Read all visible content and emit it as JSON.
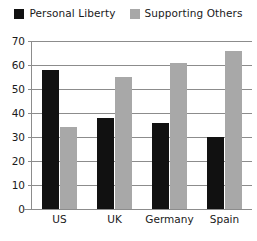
{
  "chart_data": {
    "type": "bar",
    "title": "",
    "subtitle": "",
    "xlabel": "",
    "ylabel": "",
    "categories": [
      "US",
      "UK",
      "Germany",
      "Spain"
    ],
    "series": [
      {
        "name": "Personal Liberty",
        "color": "#111111",
        "values": [
          58,
          38,
          36,
          30
        ]
      },
      {
        "name": "Supporting Others",
        "color": "#a8a8a8",
        "values": [
          34,
          55,
          61,
          66
        ]
      }
    ],
    "ylim": [
      0,
      70
    ],
    "ytick_step": 10,
    "yticks": [
      0,
      10,
      20,
      30,
      40,
      50,
      60,
      70
    ],
    "ytick_labels": [
      "0",
      "10",
      "20",
      "30",
      "40",
      "50",
      "60",
      "70"
    ],
    "grid": true,
    "grid_axis": "y",
    "legend_position": "top-center",
    "annotations": []
  },
  "legend": {
    "entries": [
      {
        "label": "Personal Liberty",
        "swatch": "black"
      },
      {
        "label": "Supporting Others",
        "swatch": "gray"
      }
    ]
  },
  "colors": {
    "series_1": "#111111",
    "series_2": "#a8a8a8",
    "axis": "#8c8c8c",
    "grid": "#8c8c8c",
    "text": "#1a1a1a",
    "background": "#ffffff"
  }
}
